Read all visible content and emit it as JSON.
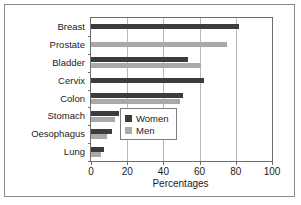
{
  "chart_data": {
    "type": "bar",
    "orientation": "horizontal",
    "title": "",
    "xlabel": "Percentages",
    "ylabel": "",
    "xlim": [
      0,
      100
    ],
    "xticks": [
      0,
      20,
      40,
      60,
      80,
      100
    ],
    "grid": true,
    "legend_position": "center-right",
    "categories": [
      "Breast",
      "Prostate",
      "Bladder",
      "Cervix",
      "Colon",
      "Stomach",
      "Oesophagus",
      "Lung"
    ],
    "series": [
      {
        "name": "Women",
        "color": "#3c3c3c",
        "values": [
          81.5,
          null,
          53.5,
          62.5,
          51,
          15.5,
          11.5,
          7
        ]
      },
      {
        "name": "Men",
        "color": "#a9a9a9",
        "values": [
          null,
          75,
          61,
          null,
          49,
          13.5,
          9,
          5.5
        ]
      }
    ]
  },
  "legend": {
    "items": [
      {
        "label": "Women"
      },
      {
        "label": "Men"
      }
    ]
  },
  "axis": {
    "x_tick_labels": [
      "0",
      "20",
      "40",
      "60",
      "80",
      "100"
    ],
    "x_axis_title": "Percentages"
  }
}
